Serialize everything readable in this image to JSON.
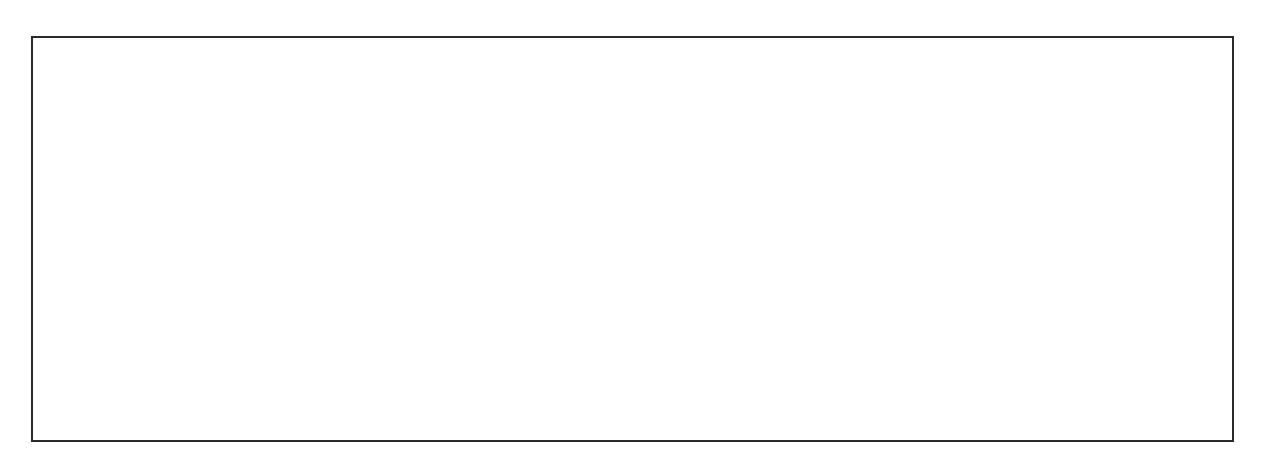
{
  "genes_above": [
    {
      "name": "LTR",
      "x1": 97,
      "x2": 164,
      "y": 196,
      "color": "#3fa9e8",
      "italic": false,
      "label_x": 130,
      "label_y": 174
    },
    {
      "name": "pol",
      "x1": 330,
      "x2": 661,
      "y": 126,
      "color": "#9c88a8",
      "italic": true,
      "label_x": 494,
      "label_y": 98
    },
    {
      "name": "env",
      "x1": 795,
      "x2": 1032,
      "y": 127,
      "color": "#f8e82c",
      "italic": true,
      "label_x": 912,
      "label_y": 98
    },
    {
      "name": "vif",
      "x1": 660,
      "x2": 713,
      "y": 198,
      "color": "#3a9e35",
      "italic": true,
      "label_x": 686,
      "label_y": 174
    },
    {
      "name": "tat",
      "x1": 733,
      "x2": 775,
      "y": 198,
      "color": "#f4a060",
      "italic": true,
      "label_x": 754,
      "label_y": 174
    },
    {
      "name": "tat",
      "x1": 1020,
      "x2": 1041,
      "y": 198,
      "color": "#f4a060",
      "italic": true,
      "label_x": 1030,
      "label_y": 174
    },
    {
      "name": "LTR",
      "x1": 1089,
      "x2": 1156,
      "y": 200,
      "color": "#3fa9e8",
      "italic": false,
      "label_x": 1122,
      "label_y": 174
    }
  ],
  "genes_below": [
    {
      "name": "gag",
      "x1": 167,
      "x2": 355,
      "y": 338,
      "color": "#f2a8b4",
      "italic": true,
      "label_x": 261,
      "label_y": 355
    },
    {
      "name": "vpr",
      "x1": 712,
      "x2": 732,
      "y": 341,
      "color": "#b8b43a",
      "italic": true,
      "label_x": 721,
      "label_y": 355
    },
    {
      "name": "rev",
      "x1": 752,
      "x2": 774,
      "y": 341,
      "color": "#ef3f6a",
      "italic": true,
      "label_x": 740,
      "label_y": 390
    },
    {
      "name": "vpu",
      "x1": 774,
      "x2": 795,
      "y": 341,
      "color": "#3a1e6e",
      "italic": true,
      "label_x": 784,
      "label_y": 355
    },
    {
      "name": "rev",
      "x1": 1016,
      "x2": 1059,
      "y": 341,
      "color": "#ef3f6a",
      "italic": true,
      "label_x": 1037,
      "label_y": 355
    },
    {
      "name": "nef",
      "x1": 1059,
      "x2": 1108,
      "y": 341,
      "color": "#3a9e35",
      "italic": true,
      "label_x": 1083,
      "label_y": 355
    }
  ],
  "segments": [
    {
      "name": "ltr-5",
      "x": 80,
      "color": "#a8d8f0",
      "striped": false
    },
    {
      "name": "gag",
      "x": 150,
      "color": "#f2a8b4",
      "striped": false
    },
    {
      "name": "gag-pol-overlap",
      "x": 315,
      "color": "#f2a8b4",
      "stripe": "#9a88a8",
      "striped": true
    },
    {
      "name": "pol",
      "x": 342,
      "color": "#9c88a8",
      "striped": false
    },
    {
      "name": "vif",
      "x": 645,
      "color": "#98c878",
      "striped": false
    },
    {
      "name": "vpr",
      "x": 698,
      "color": "#b8b43a",
      "striped": false
    },
    {
      "name": "tat",
      "x": 717,
      "color": "#f4a060",
      "striped": false
    },
    {
      "name": "tat-rev",
      "x": 737,
      "color": "#ef3f6a",
      "stripe": "#f4a060",
      "striped": true
    },
    {
      "name": "vpu",
      "x": 760,
      "color": "#3a1e6e",
      "striped": false
    },
    {
      "name": "env",
      "x": 778,
      "color": "#fbf59a",
      "striped": false
    },
    {
      "name": "tat-rev-2",
      "x": 1002,
      "color": "#ef3f6a",
      "stripe": "#f4a060",
      "striped": true
    },
    {
      "name": "rev",
      "x": 1024,
      "color": "#ef3f6a",
      "striped": false
    },
    {
      "name": "nef",
      "x": 1045,
      "color": "#3a9e35",
      "striped": false
    },
    {
      "name": "nef-ltr",
      "x": 1071,
      "color": "#3a9e35",
      "stripe": "#a8d8f0",
      "striped": true
    },
    {
      "name": "ltr-3",
      "x": 1093,
      "color": "#a8d8f0",
      "striped": false
    },
    {
      "name": "host-3",
      "x": 1142,
      "color": "#c8c8c8",
      "striped": false
    }
  ],
  "tube": {
    "left": 80,
    "right": 1190,
    "top": 241,
    "bottom": 306,
    "host_color": "#c8c8c8"
  },
  "rev_pointer": {
    "x1": 762,
    "y1": 349,
    "x2": 740,
    "y2": 388
  }
}
